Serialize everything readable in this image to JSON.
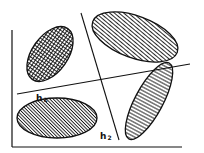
{
  "diagram": {
    "type": "hyperplane separation of clusters",
    "colors": {
      "stroke": "#111111",
      "background": "#ffffff"
    },
    "axes": {
      "x_axis": true,
      "y_axis": true
    },
    "lines": [
      {
        "id": "h1",
        "label": "h",
        "subscript": "1"
      },
      {
        "id": "h2",
        "label": "h",
        "subscript": "2"
      }
    ],
    "clusters": [
      {
        "id": "top-left",
        "fill": "crosshatch"
      },
      {
        "id": "top-right",
        "fill": "horizontal-lines"
      },
      {
        "id": "bottom-left",
        "fill": "diagonal-hatch"
      },
      {
        "id": "bottom-right",
        "fill": "vertical-lines"
      }
    ]
  }
}
